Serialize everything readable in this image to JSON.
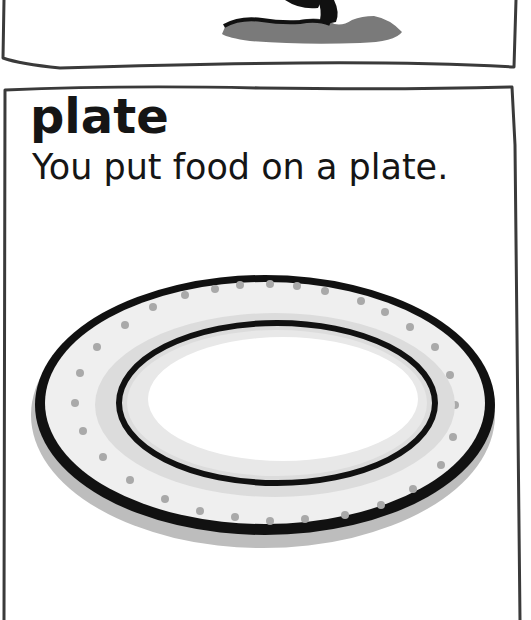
{
  "previous_card": {
    "illustration": "tree-base-on-grass"
  },
  "card": {
    "word": "plate",
    "sentence": "You put food on a plate.",
    "illustration": "plate-icon"
  },
  "colors": {
    "border": "#3a3a3a",
    "ink": "#151515",
    "shadow": "#b8b8b8",
    "rim_fill": "#e6e6e6"
  }
}
